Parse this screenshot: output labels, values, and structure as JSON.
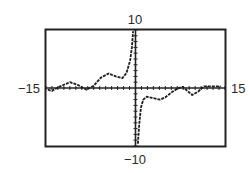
{
  "chart_data": {
    "type": "line",
    "title": "",
    "xlabel": "",
    "ylabel": "",
    "xlim": [
      -15,
      15
    ],
    "ylim": [
      -10,
      10
    ],
    "xscale": 1,
    "yscale": 1,
    "grid": false,
    "axis_labels": {
      "xmin": "−15",
      "xmax": "15",
      "ymin": "−10",
      "ymax": "10"
    },
    "series": [
      {
        "name": "f(x), x<0",
        "style": "dashed-pixel",
        "x": [
          -14.7,
          -14.0,
          -12.8,
          -11.0,
          -9.6,
          -8.2,
          -7.0,
          -5.8,
          -4.5,
          -3.3,
          -2.2,
          -1.5,
          -0.9,
          -0.6,
          -0.4
        ],
        "y": [
          -0.3,
          -0.5,
          0.2,
          1.0,
          0.5,
          -0.3,
          0.4,
          1.8,
          2.5,
          2.0,
          1.7,
          2.6,
          4.7,
          7.0,
          9.8
        ]
      },
      {
        "name": "f(x), x>0",
        "style": "dashed-pixel",
        "x": [
          0.4,
          0.6,
          0.9,
          1.3,
          1.9,
          2.8,
          4.1,
          5.0,
          6.0,
          7.0,
          7.9,
          8.7,
          9.5,
          10.5,
          11.5,
          12.8,
          14.3
        ],
        "y": [
          -9.6,
          -6.5,
          -3.4,
          -2.0,
          -1.5,
          -1.7,
          -2.0,
          -1.6,
          -0.8,
          -0.1,
          0.2,
          -0.5,
          -1.2,
          -0.6,
          0.3,
          0.3,
          0.3
        ]
      }
    ]
  }
}
